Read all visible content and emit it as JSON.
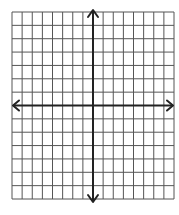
{
  "diagram": {
    "type": "coordinate-grid",
    "columns": 16,
    "rows": 14,
    "columns_left_of_y_axis": 8,
    "rows_above_x_axis": 7,
    "grid": {
      "left": 12,
      "top": 12,
      "right": 174,
      "bottom": 199
    },
    "colors": {
      "background": "#ffffff",
      "grid_line": "#555555",
      "axis": "#222222"
    },
    "axes": {
      "x_axis": {
        "arrows": [
          "left",
          "right"
        ]
      },
      "y_axis": {
        "arrows": [
          "up",
          "down"
        ]
      }
    },
    "labels": []
  }
}
